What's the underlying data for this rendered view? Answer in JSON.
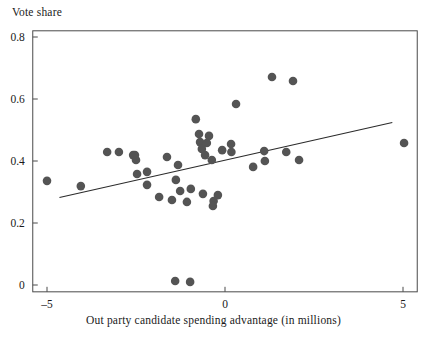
{
  "chart_data": {
    "type": "scatter",
    "title": "",
    "ylabel": "Vote share",
    "xlabel": "Out party candidate spending advantage (in millions)",
    "xlim": [
      -5.4,
      5.4
    ],
    "ylim": [
      -0.022,
      0.82
    ],
    "xticks": [
      -5,
      0,
      5
    ],
    "xtick_labels": [
      "–5",
      "0",
      "5"
    ],
    "yticks": [
      0,
      0.2,
      0.4,
      0.6,
      0.8
    ],
    "ytick_labels": [
      "0",
      "0.2",
      "0.4",
      "0.6",
      "0.8"
    ],
    "grid": false,
    "legend": null,
    "point_color": "#545454",
    "line_color": "#2b2b2b",
    "axis_color": "#4a4a4a",
    "marker_size": 4.3,
    "points": [
      {
        "x": -5.0,
        "y": 0.336
      },
      {
        "x": -4.05,
        "y": 0.319
      },
      {
        "x": -3.31,
        "y": 0.429
      },
      {
        "x": -2.98,
        "y": 0.429
      },
      {
        "x": -2.53,
        "y": 0.419
      },
      {
        "x": -2.58,
        "y": 0.419
      },
      {
        "x": -2.5,
        "y": 0.403
      },
      {
        "x": -2.47,
        "y": 0.358
      },
      {
        "x": -2.19,
        "y": 0.365
      },
      {
        "x": -2.19,
        "y": 0.323
      },
      {
        "x": -1.63,
        "y": 0.413
      },
      {
        "x": -1.32,
        "y": 0.387
      },
      {
        "x": -1.38,
        "y": 0.339
      },
      {
        "x": -1.26,
        "y": 0.303
      },
      {
        "x": -0.73,
        "y": 0.487
      },
      {
        "x": -0.45,
        "y": 0.481
      },
      {
        "x": -0.7,
        "y": 0.461
      },
      {
        "x": -0.51,
        "y": 0.458
      },
      {
        "x": -0.65,
        "y": 0.439
      },
      {
        "x": -0.56,
        "y": 0.419
      },
      {
        "x": -0.37,
        "y": 0.403
      },
      {
        "x": -0.08,
        "y": 0.435
      },
      {
        "x": -0.82,
        "y": 0.535
      },
      {
        "x": -0.96,
        "y": 0.31
      },
      {
        "x": -0.62,
        "y": 0.294
      },
      {
        "x": -0.2,
        "y": 0.29
      },
      {
        "x": -0.32,
        "y": 0.271
      },
      {
        "x": -0.34,
        "y": 0.255
      },
      {
        "x": -1.07,
        "y": 0.268
      },
      {
        "x": -1.49,
        "y": 0.274
      },
      {
        "x": -1.85,
        "y": 0.284
      },
      {
        "x": 0.31,
        "y": 0.584
      },
      {
        "x": 0.17,
        "y": 0.455
      },
      {
        "x": 0.18,
        "y": 0.429
      },
      {
        "x": 1.1,
        "y": 0.432
      },
      {
        "x": 1.72,
        "y": 0.429
      },
      {
        "x": 1.32,
        "y": 0.671
      },
      {
        "x": 1.91,
        "y": 0.658
      },
      {
        "x": 1.12,
        "y": 0.4
      },
      {
        "x": 2.08,
        "y": 0.403
      },
      {
        "x": 0.79,
        "y": 0.381
      },
      {
        "x": 5.03,
        "y": 0.458
      },
      {
        "x": -1.4,
        "y": 0.013
      },
      {
        "x": -0.98,
        "y": 0.01
      }
    ],
    "fit_line": {
      "label": "linear fit",
      "x_start": -4.65,
      "y_start": 0.282,
      "x_end": 4.7,
      "y_end": 0.524
    }
  }
}
